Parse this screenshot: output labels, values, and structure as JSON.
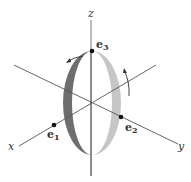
{
  "diagram": {
    "axes": {
      "x_label": "x",
      "y_label": "y",
      "z_label": "z"
    },
    "points": [
      {
        "name": "e",
        "sub": "1"
      },
      {
        "name": "e",
        "sub": "2"
      },
      {
        "name": "e",
        "sub": "3"
      }
    ],
    "colors": {
      "ring_dark": "#6b6b6b",
      "ring_light": "#c4c4c4",
      "axis": "#555555",
      "point": "#111111"
    }
  }
}
